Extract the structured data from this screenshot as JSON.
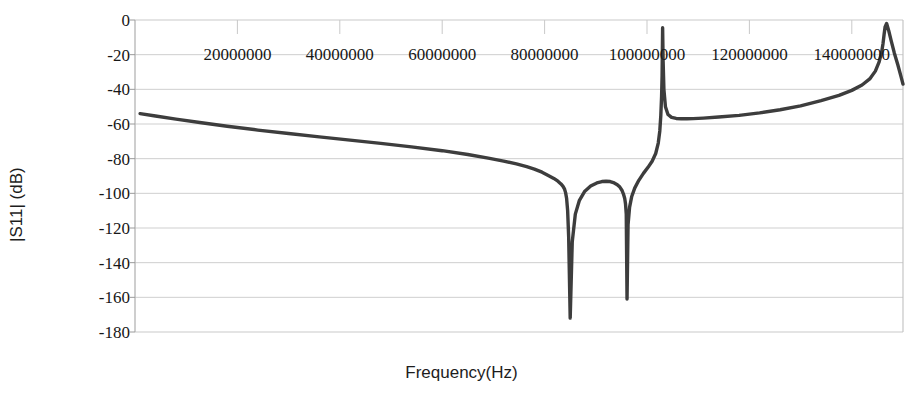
{
  "chart_data": {
    "type": "line",
    "title": "",
    "xlabel": "Frequency(Hz)",
    "ylabel": "|S11| (dB)",
    "xlim": [
      0,
      150000000
    ],
    "ylim": [
      -180,
      0
    ],
    "grid": true,
    "legend": "none",
    "xtick_labels": [
      "20000000",
      "40000000",
      "60000000",
      "80000000",
      "100000000",
      "120000000",
      "140000000"
    ],
    "xtick_values": [
      20000000,
      40000000,
      60000000,
      80000000,
      100000000,
      120000000,
      140000000
    ],
    "ytick_labels": [
      "0",
      "-20",
      "-40",
      "-60",
      "-80",
      "-100",
      "-120",
      "-140",
      "-160",
      "-180"
    ],
    "ytick_values": [
      0,
      -20,
      -40,
      -60,
      -80,
      -100,
      -120,
      -140,
      -160,
      -180
    ],
    "series": [
      {
        "name": "|S11|",
        "color": "#3d3d3d",
        "x": [
          1000000,
          4000000,
          8000000,
          13000000,
          18000000,
          24000000,
          30000000,
          36000000,
          42000000,
          48000000,
          54000000,
          60000000,
          65000000,
          69000000,
          72000000,
          74500000,
          76500000,
          78000000,
          79500000,
          80800000,
          81800000,
          82600000,
          83200000,
          83600000,
          83900000,
          84100000,
          84300000,
          84500000,
          84700000,
          85000000,
          85400000,
          86000000,
          86800000,
          87800000,
          89000000,
          90200000,
          91200000,
          92000000,
          92800000,
          93600000,
          94200000,
          94700000,
          95100000,
          95400000,
          95650000,
          95800000,
          95950000,
          96100000,
          96300000,
          96600000,
          97000000,
          97600000,
          98400000,
          99300000,
          100200000,
          101000000,
          101700000,
          102200000,
          102500000,
          102700000,
          102850000,
          102950000,
          103050000,
          103150000,
          103300000,
          103600000,
          104100000,
          104800000,
          105700000,
          106700000,
          107800000,
          109000000,
          111000000,
          114000000,
          118000000,
          122000000,
          126000000,
          130000000,
          134000000,
          137500000,
          140000000,
          142000000,
          143500000,
          144600000,
          145300000,
          145800000,
          146100000,
          146300000,
          146500000,
          146800000,
          147200000,
          147700000,
          148300000,
          149000000,
          149600000,
          150000000
        ],
        "y": [
          -54.0,
          -55.4,
          -57.2,
          -59.3,
          -61.3,
          -63.5,
          -65.5,
          -67.4,
          -69.3,
          -71.2,
          -73.2,
          -75.4,
          -77.6,
          -79.7,
          -81.4,
          -83.0,
          -84.6,
          -86.0,
          -87.8,
          -89.8,
          -91.4,
          -93.0,
          -94.6,
          -96.0,
          -97.6,
          -99.6,
          -103.0,
          -110.0,
          -125.0,
          -172.0,
          -128.0,
          -112.0,
          -104.0,
          -99.0,
          -95.8,
          -94.0,
          -93.2,
          -93.0,
          -93.2,
          -94.0,
          -95.0,
          -96.4,
          -98.2,
          -100.4,
          -103.0,
          -106.0,
          -112.0,
          -161.0,
          -118.0,
          -108.0,
          -102.0,
          -97.0,
          -92.5,
          -88.5,
          -85.0,
          -81.5,
          -77.0,
          -71.0,
          -64.0,
          -55.0,
          -44.0,
          -32.0,
          -4.5,
          -24.0,
          -40.0,
          -50.0,
          -54.5,
          -56.2,
          -56.8,
          -57.0,
          -57.0,
          -56.9,
          -56.6,
          -56.0,
          -55.0,
          -53.6,
          -51.8,
          -49.5,
          -46.5,
          -43.5,
          -40.6,
          -37.5,
          -34.0,
          -29.5,
          -24.5,
          -19.0,
          -13.5,
          -8.5,
          -4.0,
          -2.0,
          -6.0,
          -12.0,
          -19.0,
          -26.0,
          -32.5,
          -37.0
        ]
      }
    ]
  },
  "axes": {
    "plot_left_px": 135,
    "plot_right_px": 903,
    "plot_top_px": 20,
    "plot_bottom_px": 332
  }
}
